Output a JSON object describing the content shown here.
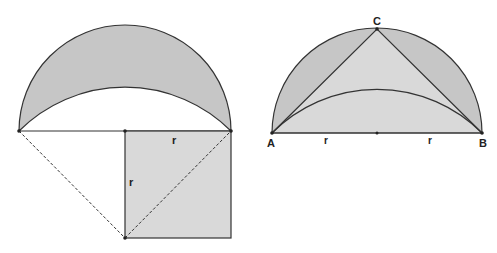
{
  "colors": {
    "stroke": "#333333",
    "lune_fill": "#c6c6c6",
    "light_fill": "#d9d9d9",
    "background": "#ffffff"
  },
  "left_figure": {
    "description": "Lune above a chord with a square of side r",
    "labels": {
      "square_top": "r",
      "square_left": "r"
    }
  },
  "right_figure": {
    "description": "Semicircle on AB with inscribed triangle ABC and inner arc",
    "labels": {
      "A": "A",
      "B": "B",
      "C": "C",
      "left_radius": "r",
      "right_radius": "r"
    }
  }
}
